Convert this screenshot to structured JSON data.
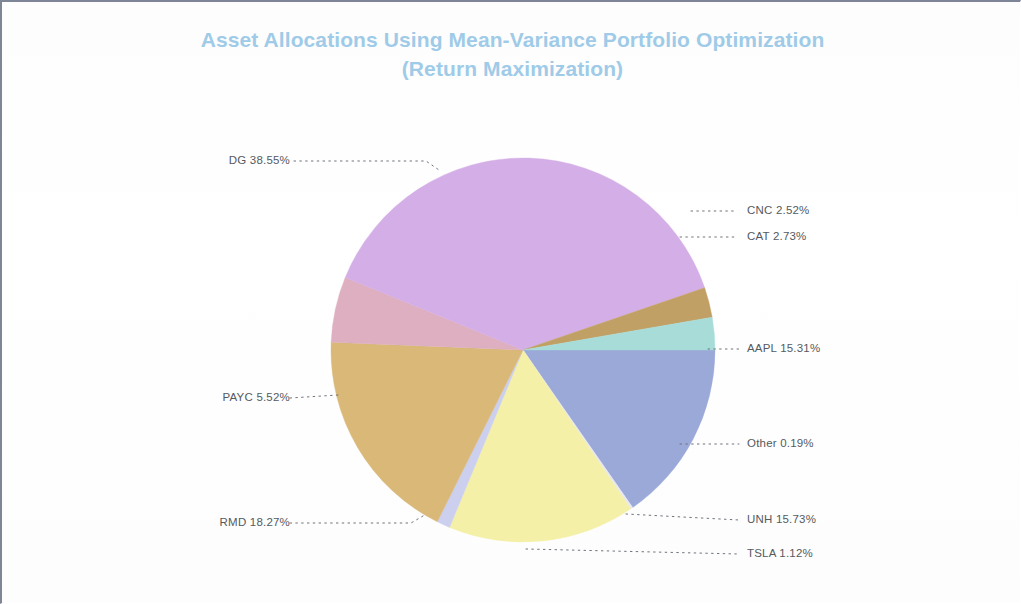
{
  "document": {
    "background_color": "#ffffff",
    "border_color": "#7d8596"
  },
  "chart_title": {
    "line1": "Asset Allocations Using Mean-Variance Portfolio Optimization",
    "line2": "(Return Maximization)",
    "full": "Asset Allocations Using Mean-Variance Portfolio Optimization\n(Return Maximization)",
    "color": "#9fcbe8"
  },
  "labels": {
    "dg": "DG 38.55%",
    "cnc": "CNC 2.52%",
    "cat": "CAT 2.73%",
    "aapl": "AAPL 15.31%",
    "other": "Other 0.19%",
    "unh": "UNH 15.73%",
    "tsla": "TSLA 1.12%",
    "rmd": "RMD 18.27%",
    "payc": "PAYC 5.52%"
  },
  "chart_data": {
    "type": "pie",
    "title": "Asset Allocations Using Mean-Variance Portfolio Optimization (Return Maximization)",
    "xlabel": "",
    "ylabel": "",
    "legend": "none",
    "grid": false,
    "value_unit": "percent",
    "label_format": "{name} {value}%",
    "start_angle_deg": 0,
    "direction": "clockwise",
    "categories": [
      "AAPL",
      "Other",
      "UNH",
      "TSLA",
      "RMD",
      "PAYC",
      "DG",
      "CNC",
      "CAT"
    ],
    "values": [
      15.31,
      0.19,
      15.73,
      1.12,
      18.27,
      5.52,
      38.55,
      2.52,
      2.73
    ],
    "colors": [
      "#9aa9d8",
      "#e8e8f2",
      "#f5f0a8",
      "#ccd0ee",
      "#d9b878",
      "#ddafc0",
      "#d4aee6",
      "#c0a064",
      "#a8dcd8"
    ],
    "slices": [
      {
        "name": "AAPL",
        "value": 15.31,
        "label": "AAPL 15.31%",
        "color": "#9aa9d8",
        "label_side": "right"
      },
      {
        "name": "Other",
        "value": 0.19,
        "label": "Other 0.19%",
        "color": "#e8e8f2",
        "label_side": "right"
      },
      {
        "name": "UNH",
        "value": 15.73,
        "label": "UNH 15.73%",
        "color": "#f5f0a8",
        "label_side": "right"
      },
      {
        "name": "TSLA",
        "value": 1.12,
        "label": "TSLA 1.12%",
        "color": "#ccd0ee",
        "label_side": "right"
      },
      {
        "name": "RMD",
        "value": 18.27,
        "label": "RMD 18.27%",
        "color": "#d9b878",
        "label_side": "left"
      },
      {
        "name": "PAYC",
        "value": 5.52,
        "label": "PAYC 5.52%",
        "color": "#ddafc0",
        "label_side": "left"
      },
      {
        "name": "DG",
        "value": 38.55,
        "label": "DG 38.55%",
        "color": "#d4aee6",
        "label_side": "left"
      },
      {
        "name": "CNC",
        "value": 2.52,
        "label": "CNC 2.52%",
        "color": "#c0a064",
        "label_side": "right"
      },
      {
        "name": "CAT",
        "value": 2.73,
        "label": "CAT 2.73%",
        "color": "#a8dcd8",
        "label_side": "right"
      }
    ],
    "total": 99.94
  }
}
